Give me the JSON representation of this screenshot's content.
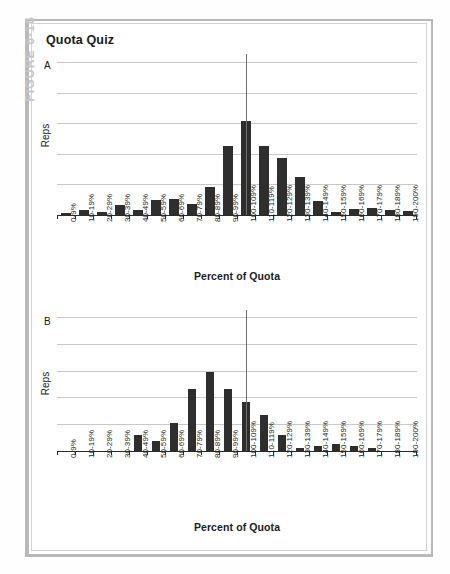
{
  "figure": {
    "label": "FIGURE 6-16",
    "title": "Quota Quiz"
  },
  "axis": {
    "xlabel": "Percent of Quota",
    "ylabel": "Reps"
  },
  "panels": [
    {
      "letter": "A"
    },
    {
      "letter": "B"
    }
  ],
  "chart_data": [
    {
      "type": "bar",
      "panel": "A",
      "title": "Quota Quiz",
      "xlabel": "Percent of Quota",
      "ylabel": "Reps",
      "grid": true,
      "gridlines": 6,
      "ylim": [
        0,
        6
      ],
      "annotation": "vertical reference line at 100-109%",
      "categories": [
        "0-9%",
        "10-19%",
        "20-29%",
        "30-39%",
        "40-49%",
        "50-59%",
        "60-69%",
        "70-79%",
        "80-89%",
        "90-99%",
        "100-109%",
        "110-119%",
        "120-129%",
        "130-139%",
        "140-149%",
        "150-159%",
        "160-169%",
        "170-179%",
        "180-189%",
        "190-200%"
      ],
      "values": [
        0.08,
        0.22,
        0.13,
        0.42,
        0.23,
        0.62,
        0.66,
        0.45,
        1.18,
        2.93,
        4.0,
        2.93,
        2.43,
        1.63,
        0.58,
        0.14,
        0.25,
        0.3,
        0.2,
        0.16
      ]
    },
    {
      "type": "bar",
      "panel": "B",
      "title": "Quota Quiz",
      "xlabel": "Percent of Quota",
      "ylabel": "Reps",
      "grid": true,
      "gridlines": 6,
      "ylim": [
        0,
        6
      ],
      "annotation": "vertical reference line at 100-109%",
      "categories": [
        "0-9%",
        "10-19%",
        "20-29%",
        "30-39%",
        "40-49%",
        "50-59%",
        "60-69%",
        "70-79%",
        "80-89%",
        "90-99%",
        "100-109%",
        "110-119%",
        "120-129%",
        "130-139%",
        "140-149%",
        "150-159%",
        "160-169%",
        "170-179%",
        "180-189%",
        "190-200%"
      ],
      "values": [
        0,
        0,
        0,
        0,
        0.74,
        0.47,
        1.31,
        2.88,
        3.63,
        2.87,
        2.27,
        1.64,
        0.72,
        0.12,
        0.25,
        0.33,
        0.22,
        0.13,
        0,
        0
      ]
    }
  ],
  "colors": {
    "bar": "#2e2e2e",
    "grid": "#c9c9c9",
    "axis": "#2b2b2b",
    "figure_label": "#c7c7c7",
    "frame": "#b9b9b9"
  }
}
